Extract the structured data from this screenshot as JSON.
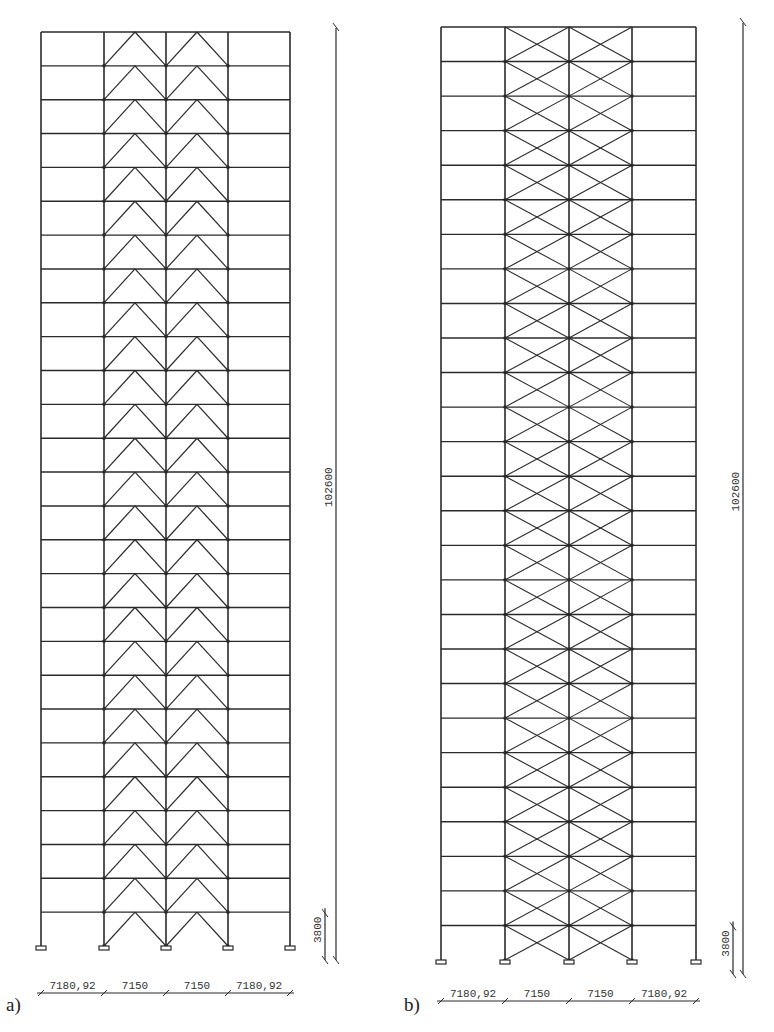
{
  "figure": {
    "panels": [
      {
        "id": "a",
        "caption": "a)",
        "bracing_type": "chevron (inverted-V) in two central bays",
        "stories": 27,
        "bays": 4,
        "total_height_label": "102600",
        "story_height_label": "3800",
        "bay_width_labels": [
          "7180,92",
          "7150",
          "7150",
          "7180,92"
        ]
      },
      {
        "id": "b",
        "caption": "b)",
        "bracing_type": "X-bracing in two central bays",
        "stories": 27,
        "bays": 4,
        "total_height_label": "102600",
        "story_height_label": "3800",
        "bay_width_labels": [
          "7180,92",
          "7150",
          "7150",
          "7180,92"
        ]
      }
    ],
    "colors": {
      "line": "#2a2a2a",
      "background": "#ffffff"
    }
  }
}
